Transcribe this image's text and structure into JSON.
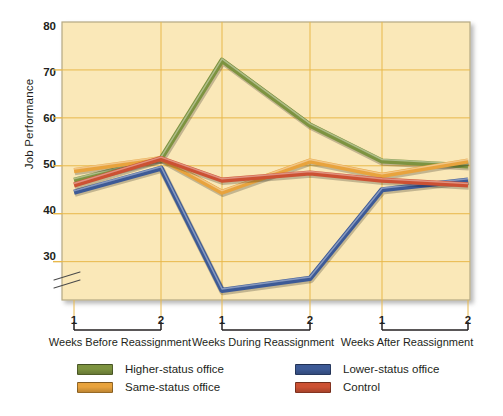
{
  "chart_data": {
    "type": "line",
    "title": "",
    "xlabel": "",
    "ylabel": "Job Performance",
    "ylim": [
      22,
      80
    ],
    "yticks": [
      30,
      40,
      50,
      60,
      70,
      80
    ],
    "ytick_labels": [
      "30",
      "40",
      "50",
      "60",
      "70",
      "80"
    ],
    "axis_break": true,
    "grid": true,
    "legend_position": "bottom",
    "x": [
      "Before 1",
      "Before 2",
      "During 1",
      "During 2",
      "After 1",
      "After 2"
    ],
    "xtick_labels": [
      "1",
      "2",
      "1",
      "2",
      "1",
      "2"
    ],
    "x_groups": [
      {
        "label": "Weeks Before Reassignment",
        "ticks": [
          "1",
          "2"
        ]
      },
      {
        "label": "Weeks During Reassignment",
        "ticks": [
          "1",
          "2"
        ]
      },
      {
        "label": "Weeks After Reassignment",
        "ticks": [
          "1",
          "2"
        ]
      }
    ],
    "series": [
      {
        "name": "Higher-status office",
        "color": "#7d9340",
        "values": [
          47,
          51.5,
          72,
          58.5,
          51,
          50
        ]
      },
      {
        "name": "Same-status office",
        "color": "#e8a33d",
        "values": [
          49,
          51.5,
          44.5,
          51,
          48,
          51
        ]
      },
      {
        "name": "Lower-status office",
        "color": "#3d5a96",
        "values": [
          44.5,
          49.5,
          24,
          26.5,
          45,
          47
        ]
      },
      {
        "name": "Control",
        "color": "#cc5133",
        "values": [
          46,
          51.5,
          47,
          48.5,
          47,
          46
        ]
      }
    ]
  },
  "legend": {
    "items": [
      {
        "label": "Higher-status office",
        "color": "#7d9340"
      },
      {
        "label": "Same-status office",
        "color": "#e8a33d"
      },
      {
        "label": "Lower-status office",
        "color": "#3d5a96"
      },
      {
        "label": "Control",
        "color": "#cc5133"
      }
    ]
  },
  "colors": {
    "plot_background": "#fae8b8",
    "gridline": "#e8b84b",
    "axis": "#b5a882",
    "text": "#231f20",
    "page_background": "#ffffff"
  }
}
